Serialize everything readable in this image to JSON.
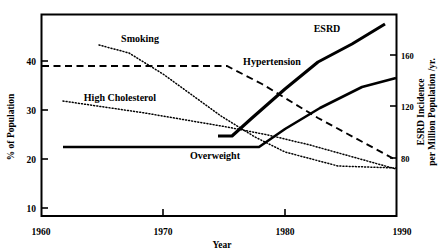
{
  "chart_data": {
    "type": "line",
    "title": "",
    "xlabel": "Year",
    "ylabel": "% of Population",
    "y2label": "ESRD Incidence per Million Population /yr.",
    "xlim": [
      1960,
      1990
    ],
    "ylim": [
      10,
      48
    ],
    "y2lim": [
      62,
      192
    ],
    "xticks": [
      "1960",
      "1970",
      "1980",
      "1990"
    ],
    "xtick_values": [
      1960,
      1970,
      1980,
      1990
    ],
    "yticks": [
      "10",
      "20",
      "30",
      "40"
    ],
    "ytick_values": [
      10,
      20,
      30,
      40
    ],
    "y2ticks": [
      "80",
      "120",
      "160"
    ],
    "y2tick_values": [
      80,
      120,
      160
    ],
    "grid": false,
    "legend": "inline-annotations",
    "series": [
      {
        "name": "Smoking",
        "axis": "left",
        "style": "dotted",
        "label_x": 1973.5,
        "label_y": 43.5,
        "x": [
          1964.8,
          1971.0,
          1978.0,
          1984.0,
          1990.0
        ],
        "y": [
          42.5,
          40.7,
          36.3,
          32.0,
          27.3
        ]
      },
      {
        "name": "Hypertension",
        "axis": "left",
        "style": "dashed",
        "label_x": 1980.0,
        "label_y": 39.6,
        "x": [
          1960.0,
          1977.5,
          1983.0,
          1990.0
        ],
        "y": [
          38.9,
          38.9,
          35.1,
          26.9
        ]
      },
      {
        "name": "High Cholesterol",
        "axis": "left",
        "style": "dotted",
        "label_x": 1973.0,
        "label_y": 30.3,
        "x": [
          1967.5,
          1975.0,
          1982.0,
          1990.0
        ],
        "y": [
          31.8,
          30.3,
          27.6,
          21.6
        ]
      },
      {
        "name": "Overweight",
        "axis": "left",
        "style": "solid",
        "label_x": 1977.0,
        "label_y": 22.2,
        "x": [
          1961.8,
          1978.3,
          1983.5,
          1990.0
        ],
        "y": [
          23.7,
          23.7,
          27.4,
          36.8
        ]
      },
      {
        "name": "ESRD",
        "axis": "right",
        "style": "solid-bold",
        "label_x": 1983.5,
        "label_y": 45.7,
        "x": [
          1974.5,
          1976.0,
          1980.5,
          1985.0,
          1990.0
        ],
        "y": [
          66.0,
          70.0,
          105.0,
          140.0,
          186.0
        ]
      }
    ]
  },
  "axis_labels": {
    "y_left": "% of Population",
    "y_right": "ESRD Incidence per Million Population /yr.",
    "x": "Year"
  },
  "colors": {
    "line": "#000000",
    "frame": "#000000",
    "background": "#ffffff"
  }
}
